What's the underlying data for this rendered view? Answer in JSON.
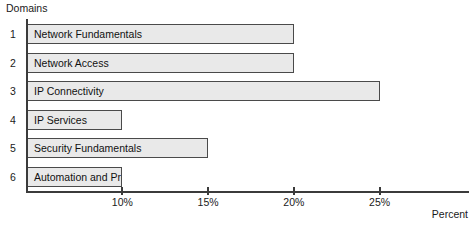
{
  "chart_data": {
    "type": "bar",
    "orientation": "horizontal",
    "title": "",
    "ylabel": "Domains",
    "xlabel": "Percent",
    "xlim": [
      4.5,
      26.0
    ],
    "grid": false,
    "legend": null,
    "categories": [
      "Network Fundamentals",
      "Network Access",
      "IP Connectivity",
      "IP Services",
      "Security Fundamentals",
      "Automation and Programmability"
    ],
    "category_indices": [
      "1",
      "2",
      "3",
      "4",
      "5",
      "6"
    ],
    "values": [
      20,
      20,
      25,
      10,
      15,
      10
    ],
    "value_unit": "%",
    "xticks": [
      10,
      15,
      20,
      25
    ],
    "xtick_labels": [
      "10%",
      "15%",
      "20%",
      "25%"
    ],
    "bar_fill_color": "#e9e9e9",
    "bar_border_color": "#4a4a4a",
    "axis_color": "#3b3b3b"
  },
  "footer": {
    "caption": ""
  }
}
